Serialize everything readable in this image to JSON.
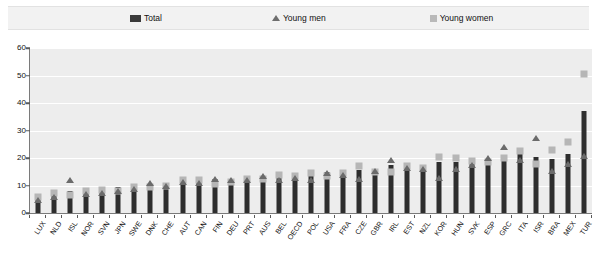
{
  "legend": {
    "total": "Total",
    "young_men": "Young men",
    "young_women": "Young women"
  },
  "colors": {
    "total": "#2e2e2e",
    "young_men": "#6b6b6b",
    "young_women": "#b6b6b6",
    "plot_background": "#ededed",
    "gridline": "#ffffff",
    "axis": "#7a7a7a"
  },
  "chart_data": {
    "type": "bar",
    "title": "",
    "subtitle": "",
    "xlabel": "",
    "ylabel": "",
    "ylim": [
      0,
      60
    ],
    "yticks": [
      0,
      10,
      20,
      30,
      40,
      50,
      60
    ],
    "grid": true,
    "legend_position": "top",
    "categories": [
      "LUX",
      "NLD",
      "ISL",
      "NOR",
      "SVN",
      "JPN",
      "SWE",
      "DNK",
      "CHE",
      "AUT",
      "CAN",
      "FIN",
      "DEU",
      "PRT",
      "AUS",
      "BEL",
      "OECD",
      "POL",
      "USA",
      "FRA",
      "CZE",
      "GBR",
      "IRL",
      "EST",
      "NZL",
      "KOR",
      "HUN",
      "SVK",
      "ESP",
      "GRC",
      "ITA",
      "ISR",
      "BRA",
      "MEX",
      "TUR"
    ],
    "series": [
      {
        "name": "Total",
        "marker": "bar",
        "values": [
          6.5,
          7.5,
          8.0,
          8.5,
          9.0,
          9.5,
          10.0,
          10.5,
          11.0,
          11.5,
          12.0,
          12.5,
          12.5,
          13.0,
          13.5,
          14.0,
          14.5,
          14.5,
          15.0,
          15.5,
          15.5,
          16.0,
          17.5,
          18.0,
          15.5,
          18.5,
          18.5,
          19.0,
          19.5,
          20.5,
          21.5,
          20.5,
          19.5,
          21.5,
          37.0
        ]
      },
      {
        "name": "Young men",
        "marker": "triangle",
        "values": [
          6.0,
          7.0,
          13.0,
          8.0,
          8.5,
          9.0,
          10.0,
          12.0,
          11.0,
          12.5,
          12.0,
          13.5,
          13.0,
          13.0,
          14.5,
          13.0,
          14.0,
          13.0,
          15.5,
          15.0,
          13.5,
          16.5,
          20.5,
          17.5,
          17.0,
          14.0,
          17.0,
          18.5,
          21.0,
          25.0,
          20.5,
          28.5,
          16.5,
          19.0,
          22.0
        ]
      },
      {
        "name": "Young women",
        "marker": "square",
        "values": [
          8.5,
          10.0,
          9.0,
          10.5,
          11.0,
          10.5,
          12.0,
          12.0,
          12.5,
          14.5,
          14.5,
          13.0,
          14.0,
          15.0,
          15.0,
          16.5,
          16.0,
          17.0,
          16.0,
          17.0,
          19.5,
          17.5,
          17.5,
          19.5,
          19.0,
          23.0,
          22.5,
          21.5,
          21.0,
          22.5,
          25.0,
          20.5,
          25.5,
          28.5,
          53.0
        ]
      }
    ]
  }
}
